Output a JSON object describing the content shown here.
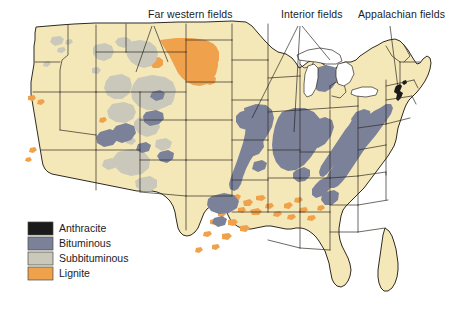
{
  "figure": {
    "kind": "thematic-map",
    "background_color": "#ffffff",
    "land_color": "#f5e8b8",
    "border_color": "#2e2a22"
  },
  "callouts": [
    {
      "id": "far-western",
      "label": "Far western fields",
      "x": 148,
      "y": 18
    },
    {
      "id": "interior",
      "label": "Interior fields",
      "x": 281,
      "y": 18
    },
    {
      "id": "appalachian",
      "label": "Appalachian fields",
      "x": 358,
      "y": 18
    }
  ],
  "legend": {
    "title": "",
    "items": [
      {
        "label": "Anthracite",
        "color": "#1a1a1a"
      },
      {
        "label": "Bituminous",
        "color": "#7b8199"
      },
      {
        "label": "Subbituminous",
        "color": "#c9c8ba"
      },
      {
        "label": "Lignite",
        "color": "#f0a14b"
      }
    ]
  },
  "map_data": {
    "type": "choropleth-overlay",
    "regions": [
      {
        "name": "Northern Great Plains lignite",
        "rank": "Lignite",
        "states": [
          "North Dakota",
          "South Dakota",
          "Montana"
        ]
      },
      {
        "name": "Gulf Coast lignite",
        "rank": "Lignite",
        "states": [
          "Texas",
          "Louisiana",
          "Mississippi",
          "Alabama",
          "Arkansas"
        ]
      },
      {
        "name": "Powder River Basin",
        "rank": "Subbituminous",
        "states": [
          "Wyoming",
          "Montana"
        ]
      },
      {
        "name": "Green River / Uinta Basin",
        "rank": "Subbituminous",
        "states": [
          "Wyoming",
          "Colorado",
          "Utah"
        ]
      },
      {
        "name": "Four Corners fields",
        "rank": "Subbituminous",
        "states": [
          "New Mexico",
          "Arizona",
          "Colorado"
        ]
      },
      {
        "name": "Appalachian Basin",
        "rank": "Bituminous",
        "states": [
          "Pennsylvania",
          "Ohio",
          "West Virginia",
          "Kentucky",
          "Virginia",
          "Tennessee",
          "Alabama"
        ]
      },
      {
        "name": "Illinois Basin",
        "rank": "Bituminous",
        "states": [
          "Illinois",
          "Indiana",
          "Kentucky"
        ]
      },
      {
        "name": "Western Interior Basin",
        "rank": "Bituminous",
        "states": [
          "Iowa",
          "Missouri",
          "Kansas",
          "Oklahoma",
          "Arkansas"
        ]
      },
      {
        "name": "Anthracite field",
        "rank": "Anthracite",
        "states": [
          "Pennsylvania"
        ]
      }
    ]
  }
}
